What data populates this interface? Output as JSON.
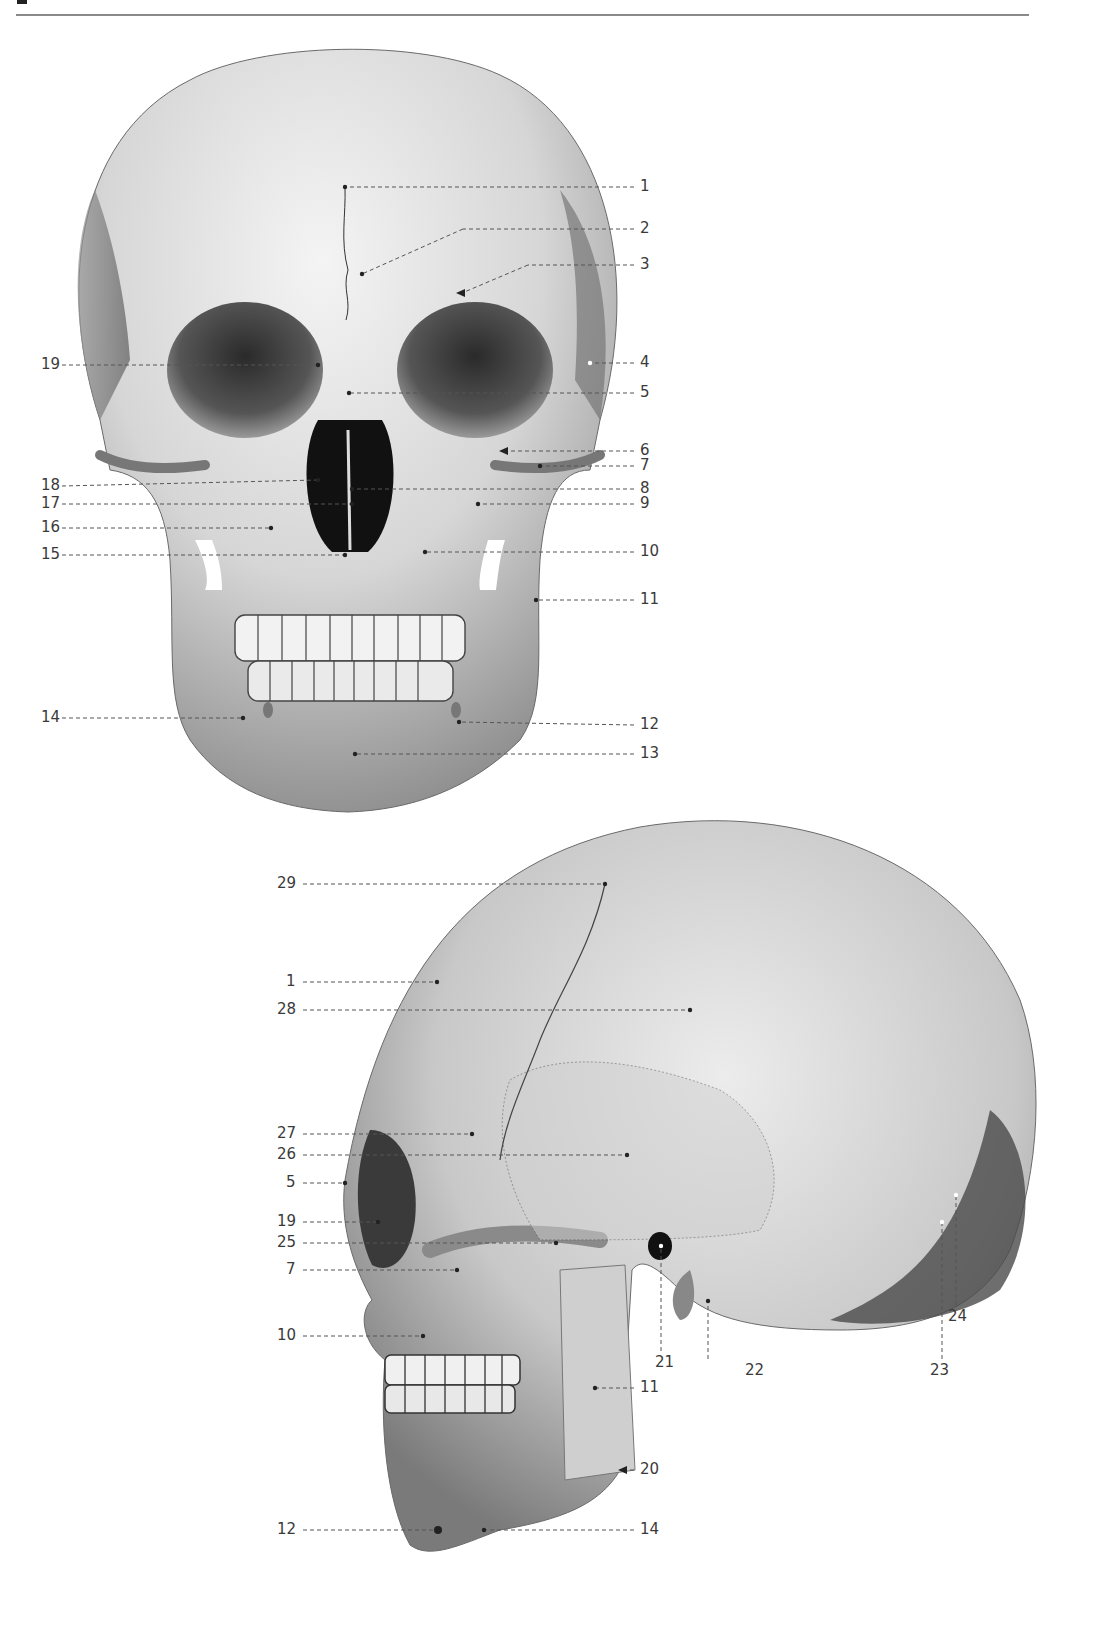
{
  "page": {
    "header_rule": true
  },
  "figures": {
    "anterior_view": {
      "name": "skull-anterior-view",
      "labels_right": [
        {
          "num": "1",
          "x": 640,
          "y": 187,
          "tx": 345,
          "ty": 187
        },
        {
          "num": "2",
          "x": 640,
          "y": 229,
          "tx": 362,
          "ty": 274
        },
        {
          "num": "3",
          "x": 640,
          "y": 265,
          "tx": 462,
          "ty": 293
        },
        {
          "num": "4",
          "x": 640,
          "y": 363,
          "tx": 590,
          "ty": 363
        },
        {
          "num": "5",
          "x": 640,
          "y": 393,
          "tx": 349,
          "ty": 393
        },
        {
          "num": "6",
          "x": 640,
          "y": 451,
          "tx": 505,
          "ty": 451
        },
        {
          "num": "7",
          "x": 640,
          "y": 466,
          "tx": 540,
          "ty": 466
        },
        {
          "num": "8",
          "x": 640,
          "y": 489,
          "tx": 352,
          "ty": 489
        },
        {
          "num": "9",
          "x": 640,
          "y": 504,
          "tx": 478,
          "ty": 504
        },
        {
          "num": "10",
          "x": 640,
          "y": 552,
          "tx": 425,
          "ty": 552
        },
        {
          "num": "11",
          "x": 640,
          "y": 600,
          "tx": 536,
          "ty": 600
        },
        {
          "num": "12",
          "x": 640,
          "y": 725,
          "tx": 459,
          "ty": 722
        },
        {
          "num": "13",
          "x": 640,
          "y": 754,
          "tx": 355,
          "ty": 754
        }
      ],
      "labels_left": [
        {
          "num": "19",
          "x": 20,
          "y": 365,
          "tx": 318,
          "ty": 365
        },
        {
          "num": "18",
          "x": 20,
          "y": 486,
          "tx": 318,
          "ty": 480
        },
        {
          "num": "17",
          "x": 20,
          "y": 504,
          "tx": 352,
          "ty": 504
        },
        {
          "num": "16",
          "x": 20,
          "y": 528,
          "tx": 271,
          "ty": 528
        },
        {
          "num": "15",
          "x": 20,
          "y": 555,
          "tx": 345,
          "ty": 555
        },
        {
          "num": "14",
          "x": 20,
          "y": 718,
          "tx": 243,
          "ty": 718
        }
      ]
    },
    "lateral_view": {
      "name": "skull-lateral-view",
      "labels_left": [
        {
          "num": "29",
          "x": 275,
          "y": 884,
          "tx": 605,
          "ty": 884
        },
        {
          "num": "1",
          "x": 275,
          "y": 982,
          "tx": 437,
          "ty": 982
        },
        {
          "num": "28",
          "x": 275,
          "y": 1010,
          "tx": 690,
          "ty": 1010
        },
        {
          "num": "27",
          "x": 275,
          "y": 1134,
          "tx": 472,
          "ty": 1134
        },
        {
          "num": "26",
          "x": 275,
          "y": 1155,
          "tx": 627,
          "ty": 1155
        },
        {
          "num": "5",
          "x": 275,
          "y": 1183,
          "tx": 345,
          "ty": 1183
        },
        {
          "num": "19",
          "x": 275,
          "y": 1222,
          "tx": 378,
          "ty": 1222
        },
        {
          "num": "25",
          "x": 275,
          "y": 1243,
          "tx": 556,
          "ty": 1243
        },
        {
          "num": "7",
          "x": 275,
          "y": 1270,
          "tx": 457,
          "ty": 1270
        },
        {
          "num": "10",
          "x": 275,
          "y": 1336,
          "tx": 423,
          "ty": 1336
        },
        {
          "num": "12",
          "x": 275,
          "y": 1530,
          "tx": 438,
          "ty": 1530
        }
      ],
      "labels_right": [
        {
          "num": "11",
          "x": 640,
          "y": 1388,
          "tx": 595,
          "ty": 1388
        },
        {
          "num": "20",
          "x": 640,
          "y": 1470,
          "tx": 618,
          "ty": 1470,
          "arrow": true
        },
        {
          "num": "14",
          "x": 640,
          "y": 1530,
          "tx": 484,
          "ty": 1530
        }
      ],
      "labels_below": [
        {
          "num": "21",
          "x": 655,
          "y": 1363,
          "tx": 661,
          "ty": 1246
        },
        {
          "num": "22",
          "x": 745,
          "y": 1371,
          "tx": 708,
          "ty": 1301
        },
        {
          "num": "23",
          "x": 930,
          "y": 1371,
          "tx": 942,
          "ty": 1222
        },
        {
          "num": "24",
          "x": 948,
          "y": 1317,
          "tx": 956,
          "ty": 1195
        }
      ]
    }
  },
  "colors": {
    "ink": "#3a3a3a",
    "leader": "#555555",
    "rule": "#8a8a8a",
    "bone_light": "#e8e8e8",
    "bone_mid": "#b5b5b5",
    "bone_dark": "#5a5a5a",
    "cavity": "#1a1a1a"
  }
}
